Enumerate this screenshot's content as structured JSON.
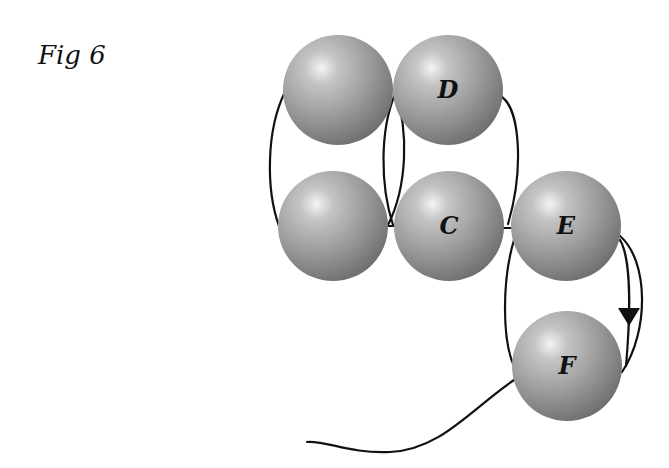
{
  "figure": {
    "title": "Fig 6"
  },
  "diagram": {
    "type": "beading-thread-path",
    "bead_color": "#9a9a9a",
    "thread_color": "#111111",
    "beads": [
      {
        "id": "top-left",
        "label": "",
        "cx": 338,
        "cy": 90,
        "r": 55
      },
      {
        "id": "D",
        "label": "D",
        "cx": 448,
        "cy": 90,
        "r": 55
      },
      {
        "id": "mid-left",
        "label": "",
        "cx": 333,
        "cy": 226,
        "r": 55
      },
      {
        "id": "C",
        "label": "C",
        "cx": 449,
        "cy": 226,
        "r": 55
      },
      {
        "id": "E",
        "label": "E",
        "cx": 566,
        "cy": 226,
        "r": 55
      },
      {
        "id": "F",
        "label": "F",
        "cx": 567,
        "cy": 366,
        "r": 55
      }
    ],
    "arrow": {
      "direction": "down",
      "x": 628,
      "y": 316
    }
  }
}
